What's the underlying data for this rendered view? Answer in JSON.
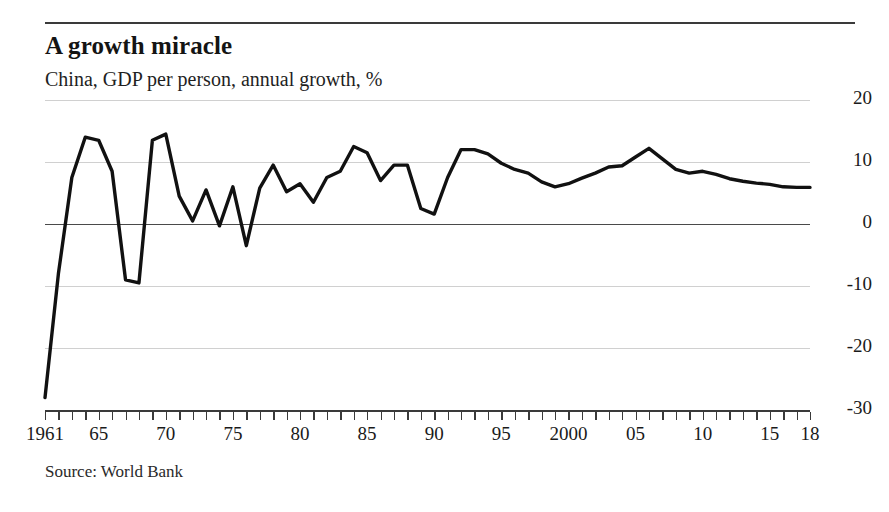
{
  "header": {
    "title": "A growth miracle",
    "subtitle": "China, GDP per person, annual growth, %"
  },
  "footer": {
    "source": "Source: World Bank"
  },
  "colors": {
    "line": "#111111",
    "grid": "#d0d0d0",
    "axis": "#3a3a3a",
    "text": "#1a1a1a"
  },
  "chart_data": {
    "type": "line",
    "title": "A growth miracle",
    "subtitle": "China, GDP per person, annual growth, %",
    "xlabel": "",
    "ylabel": "%",
    "ylim": [
      -30,
      20
    ],
    "xlim": [
      1961,
      2018
    ],
    "grid": true,
    "legend": "none",
    "y_ticks": [
      20,
      10,
      0,
      -10,
      -20,
      -30
    ],
    "y_tick_labels": [
      "20",
      "10",
      "0",
      "-10",
      "-20",
      "-30"
    ],
    "x_ticks": [
      1961,
      1965,
      1970,
      1975,
      1980,
      1985,
      1990,
      1995,
      2000,
      2005,
      2010,
      2015,
      2018
    ],
    "x_tick_labels": [
      "1961",
      "65",
      "70",
      "75",
      "80",
      "85",
      "90",
      "95",
      "2000",
      "05",
      "10",
      "15",
      "18"
    ],
    "x_minor_tick_interval": 1,
    "series": [
      {
        "name": "China, GDP per person, annual growth, %",
        "x": [
          1961,
          1962,
          1963,
          1964,
          1965,
          1966,
          1967,
          1968,
          1969,
          1970,
          1971,
          1972,
          1973,
          1974,
          1975,
          1976,
          1977,
          1978,
          1979,
          1980,
          1981,
          1982,
          1983,
          1984,
          1985,
          1986,
          1987,
          1988,
          1989,
          1990,
          1991,
          1992,
          1993,
          1994,
          1995,
          1996,
          1997,
          1998,
          1999,
          2000,
          2001,
          2002,
          2003,
          2004,
          2005,
          2006,
          2007,
          2008,
          2009,
          2010,
          2011,
          2012,
          2013,
          2014,
          2015,
          2016,
          2017,
          2018
        ],
        "values": [
          -28.0,
          -8.0,
          7.5,
          14.0,
          13.5,
          8.5,
          -9.0,
          -9.5,
          13.5,
          14.5,
          4.5,
          0.5,
          5.5,
          -0.3,
          6.0,
          -3.5,
          5.8,
          9.5,
          5.2,
          6.5,
          3.5,
          7.5,
          8.5,
          12.5,
          11.5,
          7.0,
          9.5,
          9.5,
          2.5,
          1.6,
          7.5,
          12.0,
          12.0,
          11.3,
          9.8,
          8.8,
          8.2,
          6.8,
          6.0,
          6.5,
          7.4,
          8.2,
          9.2,
          9.4,
          10.8,
          12.2,
          10.5,
          8.8,
          8.2,
          8.5,
          8.0,
          7.3,
          6.9,
          6.6,
          6.4,
          6.0,
          5.9,
          5.9
        ],
        "values_note": "annual % growth in GDP per person, read from gridlines at 10-unit intervals"
      }
    ]
  }
}
